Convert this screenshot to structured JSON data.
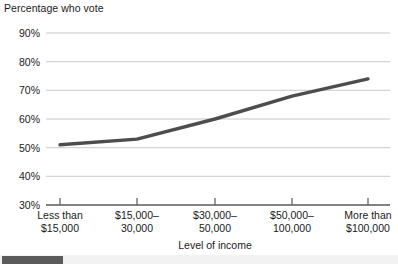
{
  "chart_data": {
    "type": "line",
    "title": "Percentage who vote",
    "xlabel": "Level of income",
    "ylabel": "Percentage who vote",
    "categories": [
      "Less than $15,000",
      "$15,000–30,000",
      "$30,000–50,000",
      "$50,000–100,000",
      "More than $100,000"
    ],
    "values": [
      51,
      53,
      60,
      68,
      74
    ],
    "ylim": [
      30,
      90
    ],
    "ytick_labels": [
      "30%",
      "40%",
      "50%",
      "60%",
      "70%",
      "80%",
      "90%"
    ],
    "ytick_values": [
      30,
      40,
      50,
      60,
      70,
      80,
      90
    ],
    "grid": true,
    "legend": null,
    "line_color": "#4d4d4d",
    "grid_color": "#c8c8c8",
    "axis_color": "#595959"
  },
  "axis": {
    "y_labels": [
      {
        "text": "90%",
        "value": 90
      },
      {
        "text": "80%",
        "value": 80
      },
      {
        "text": "70%",
        "value": 70
      },
      {
        "text": "60%",
        "value": 60
      },
      {
        "text": "50%",
        "value": 50
      },
      {
        "text": "40%",
        "value": 40
      },
      {
        "text": "30%",
        "value": 30
      }
    ],
    "x_labels": [
      {
        "line1": "Less than",
        "line2": "$15,000"
      },
      {
        "line1": "$15,000–",
        "line2": "30,000"
      },
      {
        "line1": "$30,000–",
        "line2": "50,000"
      },
      {
        "line1": "$50,000–",
        "line2": "100,000"
      },
      {
        "line1": "More than",
        "line2": "$100,000"
      }
    ],
    "x_title": "Level of income"
  },
  "scrollbar": {
    "orientation": "horizontal"
  }
}
